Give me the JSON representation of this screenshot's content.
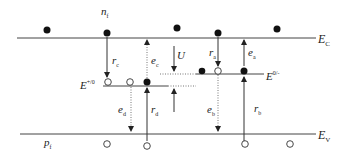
{
  "diagram": {
    "type": "energy-band-diagram",
    "bands": {
      "conduction": {
        "label": "E",
        "sub": "C"
      },
      "valence": {
        "label": "E",
        "sub": "V"
      }
    },
    "levels": {
      "donor": {
        "label": "E",
        "sup": "+/0"
      },
      "acceptor": {
        "label": "E",
        "sup": "0/-"
      }
    },
    "carriers": {
      "electrons": {
        "label": "n",
        "sub": "f"
      },
      "holes": {
        "label": "p",
        "sub": "f"
      }
    },
    "transitions": {
      "r_c": {
        "label": "r",
        "sub": "c"
      },
      "e_c": {
        "label": "e",
        "sub": "c"
      },
      "U": {
        "label": "U"
      },
      "r_a": {
        "label": "r",
        "sub": "a"
      },
      "e_a": {
        "label": "e",
        "sub": "a"
      },
      "e_d": {
        "label": "e",
        "sub": "d"
      },
      "r_d": {
        "label": "r",
        "sub": "d"
      },
      "e_b": {
        "label": "e",
        "sub": "b"
      },
      "r_b": {
        "label": "r",
        "sub": "b"
      }
    },
    "colors": {
      "line": "#444444",
      "electron": "#111111",
      "hole_fill": "#ffffff"
    }
  }
}
